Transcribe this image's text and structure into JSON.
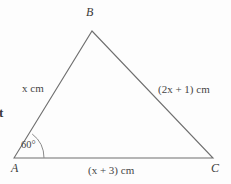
{
  "figure": {
    "type": "triangle-diagram",
    "background_color": "#fdfdfd",
    "stroke_color": "#6f6f6f",
    "text_color": "#454545"
  },
  "vertices": {
    "a": {
      "label": "A",
      "x": 14,
      "y": 158
    },
    "b": {
      "label": "B",
      "x": 92,
      "y": 31
    },
    "c": {
      "label": "C",
      "x": 213,
      "y": 158
    }
  },
  "sides": {
    "ab": {
      "label": "x cm",
      "expression": "x",
      "unit": "cm"
    },
    "bc": {
      "label": "(2x + 1) cm",
      "expression": "2x + 1",
      "unit": "cm"
    },
    "ac": {
      "label": "(x + 3) cm",
      "expression": "x + 3",
      "unit": "cm"
    }
  },
  "angle": {
    "at_vertex": "A",
    "value": "60",
    "degree_symbol": "°",
    "label": "60°"
  },
  "cropped_text": {
    "left_margin_fragment": "t"
  }
}
